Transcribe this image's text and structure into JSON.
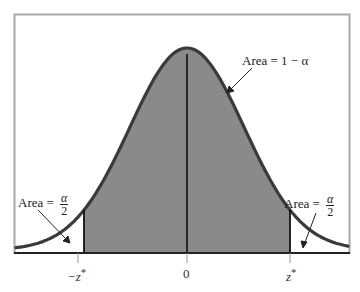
{
  "chart_data": {
    "type": "area",
    "title": "",
    "subtitle": "",
    "xlabel": "",
    "ylabel": "",
    "x_ticks": [
      "−z*",
      "0",
      "z*"
    ],
    "xlim": [
      -3.2,
      3.2
    ],
    "critical_value_z": 1.8,
    "grid": false,
    "legend": null,
    "regions": [
      {
        "name": "left-tail",
        "from": "-inf",
        "to": "-z*",
        "shaded": false,
        "label": "Area = α/2"
      },
      {
        "name": "central",
        "from": "-z*",
        "to": "z*",
        "shaded": true,
        "label": "Area = 1 − α"
      },
      {
        "name": "right-tail",
        "from": "z*",
        "to": "inf",
        "shaded": false,
        "label": "Area = α/2"
      }
    ],
    "annotations": [
      {
        "text": "Area = 1 − α",
        "points_to": "central region curve"
      },
      {
        "text": "Area = α/2",
        "points_to": "left tail"
      },
      {
        "text": "Area = α/2",
        "points_to": "right tail"
      }
    ]
  },
  "labels": {
    "center_area": "Area = 1 − α",
    "tail_prefix": "Area = ",
    "tail_num": "α",
    "tail_den": "2",
    "tick_neg": "−z",
    "tick_zero": "0",
    "tick_pos": "z",
    "star": "*"
  },
  "colors": {
    "shade": "#8a8a8a",
    "curve": "#3a3a3a",
    "frame": "#a8a8a8",
    "axis": "#222222"
  }
}
